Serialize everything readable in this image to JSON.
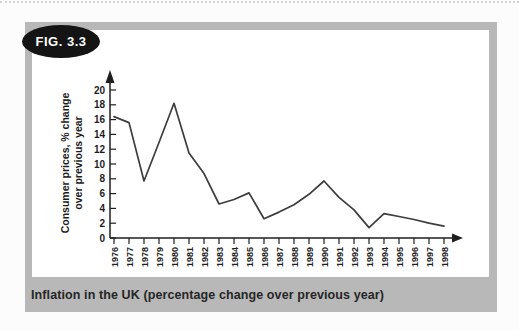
{
  "page": {
    "badge_label": "FIG. 3.3",
    "caption": "Inflation in the UK (percentage change over previous year)"
  },
  "chart_data": {
    "type": "line",
    "title": "",
    "xlabel": "",
    "ylabel": "Consumer prices, % change over previous year",
    "ylabel_lines": [
      "Consumer prices, % change",
      "over previous year"
    ],
    "categories": [
      "1976",
      "1977",
      "1978",
      "1979",
      "1980",
      "1981",
      "1982",
      "1983",
      "1984",
      "1985",
      "1986",
      "1987",
      "1988",
      "1989",
      "1990",
      "1991",
      "1992",
      "1993",
      "1994",
      "1995",
      "1996",
      "1997",
      "1998"
    ],
    "values": [
      16.4,
      15.6,
      7.7,
      12.9,
      18.2,
      11.5,
      8.7,
      4.6,
      5.2,
      6.1,
      2.6,
      3.5,
      4.5,
      5.9,
      7.7,
      5.5,
      3.8,
      1.4,
      3.3,
      2.9,
      2.5,
      2.0,
      1.6
    ],
    "ylim": [
      0,
      20
    ],
    "yticks": [
      0,
      2,
      4,
      6,
      8,
      10,
      12,
      14,
      16,
      18,
      20
    ],
    "grid": false,
    "legend": null,
    "line_color": "#3d3d3d",
    "axis_color": "#1f1f1f"
  },
  "colors": {
    "frame_gray": "#b8b8b8",
    "badge_bg": "#141414",
    "badge_text": "#ffffff",
    "caption_text": "#262626",
    "plot_bg": "#ffffff"
  }
}
